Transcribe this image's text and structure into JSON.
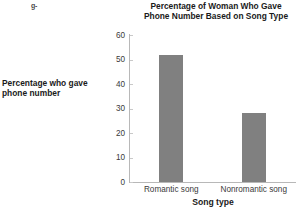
{
  "artifact": {
    "text": "g-"
  },
  "chart_data": {
    "type": "bar",
    "title": "Percentage of Woman Who Gave Phone Number Based on Song Type",
    "title_lines": [
      "Percentage of Woman Who Gave",
      "Phone Number Based on Song Type"
    ],
    "categories": [
      "Romantic song",
      "Nonromantic song"
    ],
    "values": [
      52,
      28
    ],
    "xlabel": "Song type",
    "ylabel": "Percentage who gave phone number",
    "ylabel_lines": [
      "Percentage who gave",
      "phone number"
    ],
    "ylim": [
      0,
      60
    ],
    "yticks": [
      0,
      10,
      20,
      30,
      40,
      50,
      60
    ],
    "ytick_labels": [
      "0",
      "10",
      "20",
      "30",
      "40",
      "50",
      "60"
    ],
    "grid": false,
    "legend": false,
    "bar_color": "#808080",
    "axis_color": "#b8b8b8"
  }
}
